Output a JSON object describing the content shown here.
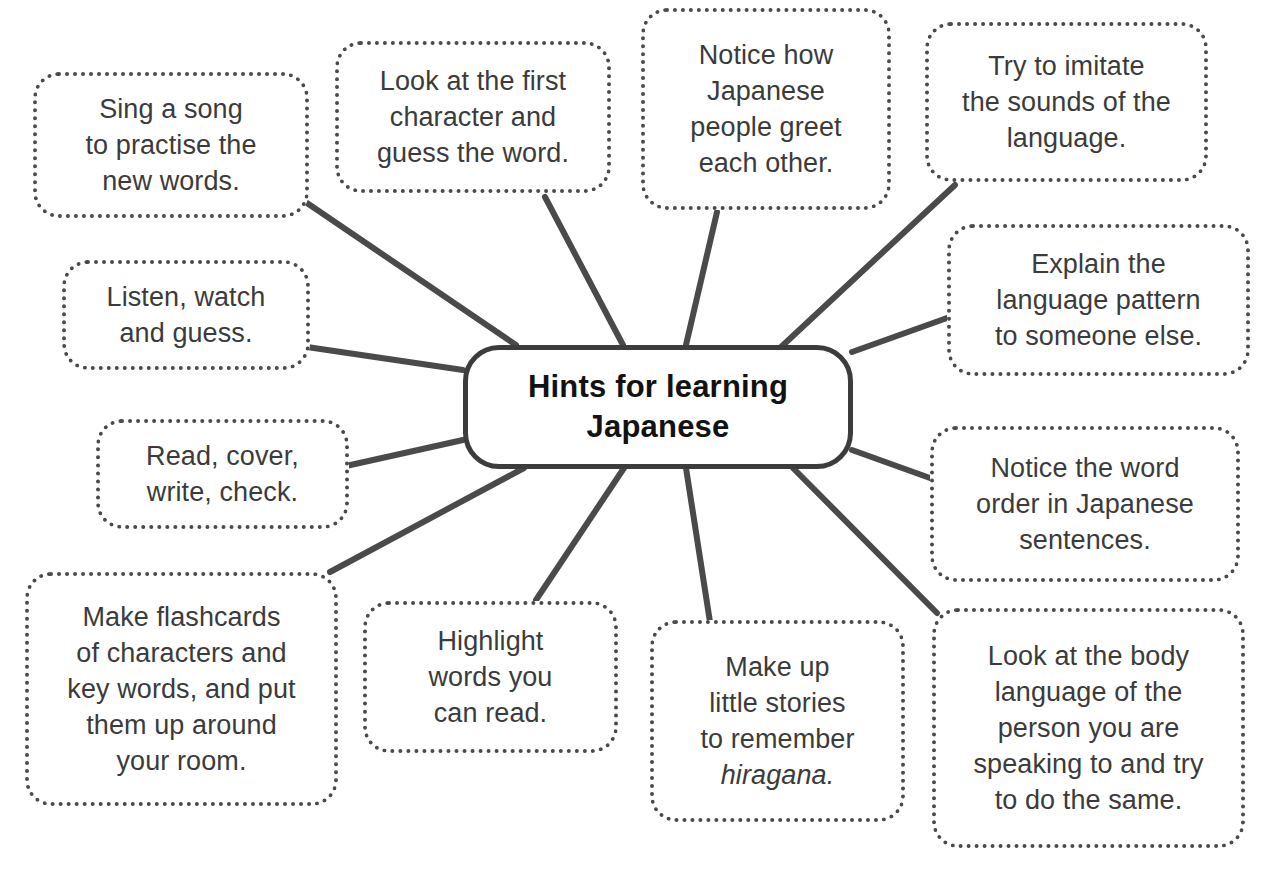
{
  "diagram": {
    "type": "mind-map",
    "title": "Hints for learning Japanese",
    "center": {
      "label": "Hints for learning\nJapanese",
      "shape": "rounded-rectangle",
      "border_style": "solid",
      "border_color": "#3c3c3c",
      "text_color": "#121212"
    },
    "style": {
      "background": "#ffffff",
      "node_border_style": "dotted",
      "node_border_color": "#4a4a4a",
      "node_text_color": "#3b3b3b",
      "connector_color": "#4a4a4a"
    },
    "branches": [
      {
        "id": "sing-a-song",
        "label": "Sing a song\nto practise the\nnew words.",
        "position": "top-left-outer"
      },
      {
        "id": "look-at-first-character",
        "label": "Look at the first\ncharacter and\nguess the word.",
        "position": "top-left-inner"
      },
      {
        "id": "notice-how-japanese-people-greet",
        "label": "Notice how\nJapanese\npeople greet\neach other.",
        "position": "top-center"
      },
      {
        "id": "try-to-imitate-sounds",
        "label": "Try to imitate\nthe sounds of the\nlanguage.",
        "position": "top-right"
      },
      {
        "id": "explain-language-pattern",
        "label": "Explain the\nlanguage pattern\nto someone else.",
        "position": "right-upper"
      },
      {
        "id": "notice-word-order",
        "label": "Notice the word\norder in Japanese\nsentences.",
        "position": "right-lower"
      },
      {
        "id": "look-at-body-language",
        "label": "Look at the body\nlanguage of the\nperson you are\nspeaking to and try\nto do the same.",
        "position": "bottom-right"
      },
      {
        "id": "make-up-little-stories",
        "label": "Make up\nlittle stories\nto remember\nhiragana.",
        "italic_word": "hiragana.",
        "position": "bottom-center"
      },
      {
        "id": "highlight-words-you-can-read",
        "label": "Highlight\nwords you\ncan read.",
        "position": "bottom-center-left"
      },
      {
        "id": "make-flashcards",
        "label": "Make flashcards\nof characters and\nkey words, and put\nthem up around\nyour room.",
        "position": "bottom-left"
      },
      {
        "id": "read-cover-write-check",
        "label": "Read, cover,\nwrite, check.",
        "position": "left-lower"
      },
      {
        "id": "listen-watch-and-guess",
        "label": "Listen, watch\nand guess.",
        "position": "left-upper"
      }
    ]
  }
}
